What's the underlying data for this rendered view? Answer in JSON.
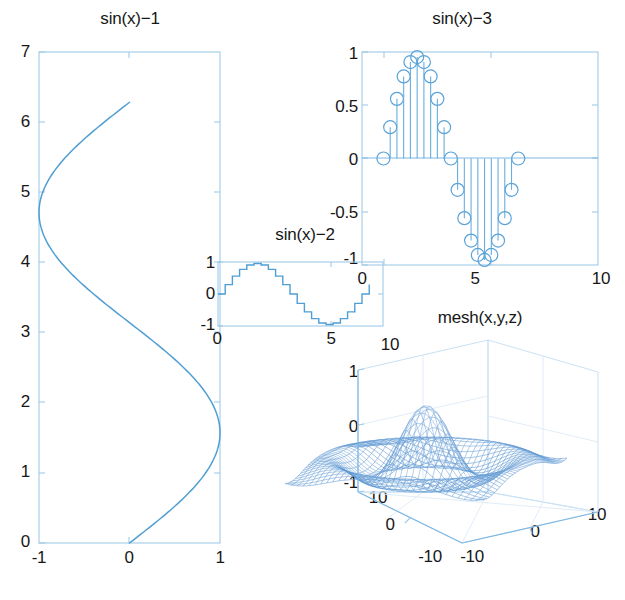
{
  "figure": {
    "background": "#ffffff",
    "line_color": "#4f9ed4",
    "axis_color": "#9ecae8",
    "text_color": "#171717",
    "width": 625,
    "height": 600
  },
  "chart_data": [
    {
      "id": "sinx-1",
      "type": "line",
      "title": "sin(x)−1",
      "xlabel": "",
      "ylabel": "",
      "orientation": "x = sin(y)",
      "xlim": [
        -1,
        1
      ],
      "ylim": [
        0,
        7
      ],
      "xticks": [
        -1,
        0,
        1
      ],
      "xticklabels": [
        "-1",
        "0",
        "1"
      ],
      "yticks": [
        0,
        1,
        2,
        3,
        4,
        5,
        6,
        7
      ],
      "yticklabels": [
        "0",
        "1",
        "2",
        "3",
        "4",
        "5",
        "6",
        "7"
      ],
      "grid": false,
      "series": [
        {
          "name": "sin",
          "note": "parametric: x = sin(t), y = t for t in [0, 6.283]",
          "t_start": 0,
          "t_end": 6.2832,
          "samples": 200
        }
      ]
    },
    {
      "id": "sinx-3",
      "type": "stem",
      "title": "sin(x)−3",
      "xlabel": "",
      "ylabel": "",
      "xlim": [
        -1,
        10
      ],
      "ylim": [
        -1.05,
        1.05
      ],
      "xticks": [
        0,
        5,
        10
      ],
      "xticklabels": [
        "0",
        "5",
        "10"
      ],
      "yticks": [
        -1,
        -0.5,
        0,
        0.5,
        1
      ],
      "yticklabels": [
        "-1",
        "-0.5",
        "0",
        "0.5",
        "1"
      ],
      "grid": false,
      "marker": "circle-open",
      "x": [
        0,
        0.314,
        0.628,
        0.942,
        1.257,
        1.571,
        1.885,
        2.199,
        2.513,
        2.827,
        3.142,
        3.456,
        3.77,
        4.084,
        4.398,
        4.712,
        5.027,
        5.341,
        5.655,
        5.969,
        6.283
      ],
      "values": [
        0,
        0.309,
        0.588,
        0.809,
        0.951,
        1,
        0.951,
        0.809,
        0.588,
        0.309,
        0,
        -0.309,
        -0.588,
        -0.809,
        -0.951,
        -1,
        -0.951,
        -0.809,
        -0.588,
        -0.309,
        0
      ]
    },
    {
      "id": "sinx-2",
      "type": "stairs",
      "title": "sin(x)−2",
      "xlabel": "",
      "ylabel": "",
      "xlim": [
        0,
        7.2
      ],
      "ylim": [
        -1.05,
        1.05
      ],
      "xticks": [
        0,
        5
      ],
      "xticklabels": [
        "0",
        "5"
      ],
      "yticks": [
        -1,
        0,
        1
      ],
      "yticklabels": [
        "-1",
        "0",
        "1"
      ],
      "grid": false,
      "x": [
        0,
        0.314,
        0.628,
        0.942,
        1.257,
        1.571,
        1.885,
        2.199,
        2.513,
        2.827,
        3.142,
        3.456,
        3.77,
        4.084,
        4.398,
        4.712,
        5.027,
        5.341,
        5.655,
        5.969,
        6.283,
        6.6
      ],
      "values": [
        0,
        0.309,
        0.588,
        0.809,
        0.951,
        1,
        0.951,
        0.809,
        0.588,
        0.309,
        0,
        -0.309,
        -0.588,
        -0.809,
        -0.951,
        -1,
        -0.951,
        -0.809,
        -0.588,
        -0.309,
        0,
        0.309
      ]
    },
    {
      "id": "mesh",
      "type": "mesh3d",
      "title": "mesh(x,y,z)",
      "xlabel": "",
      "ylabel": "",
      "zlabel": "",
      "xlim": [
        -10,
        10
      ],
      "ylim": [
        -10,
        10
      ],
      "zlim": [
        -1,
        1
      ],
      "xticks": [
        -10,
        0,
        10
      ],
      "xticklabels": [
        "-10",
        "0",
        "10"
      ],
      "yticks": [
        -10,
        0,
        10
      ],
      "yticklabels": [
        "-10",
        "0",
        "10"
      ],
      "zticks": [
        -1,
        0,
        1
      ],
      "zticklabels": [
        "-1",
        "0",
        "1"
      ],
      "surface": "sinc: sin(r)/r, r = sqrt(x^2+y^2)",
      "grid": true,
      "colormap": "blue"
    }
  ]
}
